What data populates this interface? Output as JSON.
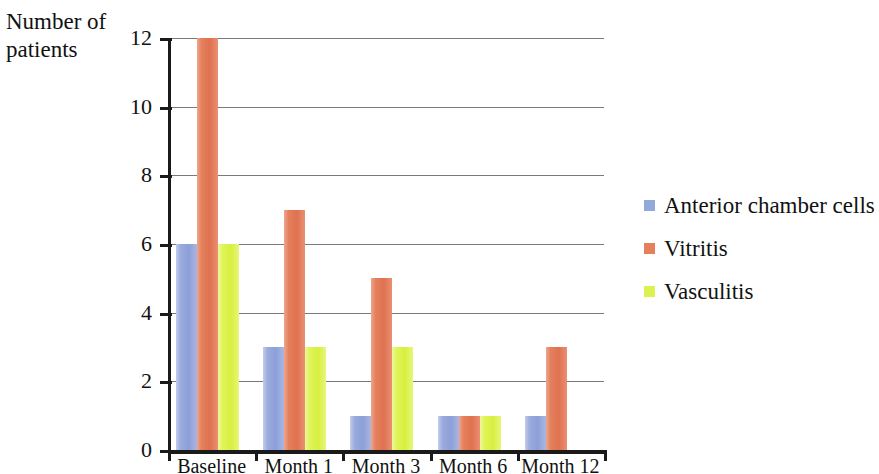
{
  "chart_data": {
    "type": "bar",
    "title": "",
    "xlabel": "",
    "ylabel": "Number of\npatients",
    "categories": [
      "Baseline",
      "Month 1",
      "Month 3",
      "Month 6",
      "Month 12"
    ],
    "series": [
      {
        "name": "Anterior chamber cells",
        "color": "#93a8db",
        "values": [
          6,
          3,
          1,
          1,
          1
        ]
      },
      {
        "name": "Vitritis",
        "color": "#e4805c",
        "values": [
          12,
          7,
          5,
          1,
          3
        ]
      },
      {
        "name": "Vasculitis",
        "color": "#dcf24e",
        "values": [
          6,
          3,
          3,
          1,
          0
        ]
      }
    ],
    "ylim": [
      0,
      12
    ],
    "yticks": [
      0,
      2,
      4,
      6,
      8,
      10,
      12
    ],
    "ytick_labels": [
      "0",
      "2",
      "4",
      "6",
      "8",
      "10",
      "12"
    ],
    "grid": true,
    "grid_axis": "y",
    "legend_position": "right",
    "background_color": "#ffffff",
    "axis_color": "#1a1a1a",
    "gridline_color": "#7a7a7a"
  },
  "axis": {
    "y_title": "Number of\npatients"
  },
  "legend": {
    "items": [
      {
        "label": "Anterior chamber cells"
      },
      {
        "label": "Vitritis"
      },
      {
        "label": "Vasculitis"
      }
    ]
  }
}
